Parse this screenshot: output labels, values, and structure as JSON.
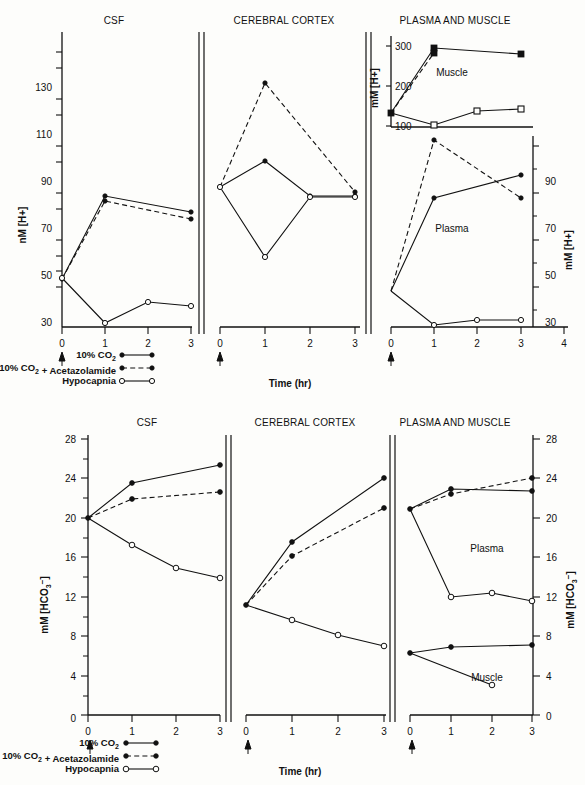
{
  "figure_top": {
    "panels": [
      "CSF",
      "CEREBRAL CORTEX",
      "PLASMA AND MUSCLE"
    ],
    "xlabel": "Time (hr)",
    "ylabel_left": "nM [H+]",
    "ylabel_right": "mM [H+]",
    "ylabel_muscle": "mM [H+]",
    "yticks_left": [
      30,
      50,
      70,
      90,
      110,
      130
    ],
    "yticks_right": [
      30,
      50,
      70,
      90
    ],
    "yticks_muscle": [
      100,
      200,
      300
    ],
    "xticks_p1": [
      0,
      1,
      2,
      3
    ],
    "xticks_p2": [
      0,
      1,
      2,
      3
    ],
    "xticks_p3": [
      0,
      1,
      2,
      3,
      4
    ],
    "series_labels": {
      "muscle": "Muscle",
      "plasma": "Plasma"
    }
  },
  "figure_bottom": {
    "panels": [
      "CSF",
      "CEREBRAL CORTEX",
      "PLASMA AND MUSCLE"
    ],
    "xlabel": "Time (hr)",
    "ylabel_left": "mM [HCO3-]",
    "ylabel_right": "mM [HCO3-]",
    "yticks": [
      0,
      4,
      8,
      12,
      16,
      20,
      24,
      28
    ],
    "xticks_p1": [
      0,
      1,
      2,
      3
    ],
    "xticks_p2": [
      0,
      1,
      2,
      3
    ],
    "xticks_p3": [
      0,
      1,
      2,
      3
    ],
    "series_labels": {
      "plasma": "Plasma",
      "muscle": "Muscle"
    }
  },
  "legend": {
    "items": [
      {
        "label": "10% CO2",
        "style": "solid-filled"
      },
      {
        "label": "10% CO2 + Acetazolamide",
        "style": "dashed-filled"
      },
      {
        "label": "Hypocapnia",
        "style": "solid-open"
      }
    ]
  },
  "chart_data": [
    {
      "type": "line",
      "title": "CSF",
      "figure": "top",
      "xlabel": "Time (hr)",
      "ylabel": "nM [H+]",
      "xlim": [
        0,
        3.4
      ],
      "ylim": [
        18,
        140
      ],
      "yticks": [
        30,
        50,
        70,
        90,
        110,
        130
      ],
      "grid": false,
      "series": [
        {
          "name": "10% CO2",
          "marker": "filled-circle",
          "line": "solid",
          "x": [
            0,
            1,
            3
          ],
          "values": [
            50,
            85,
            78
          ]
        },
        {
          "name": "10% CO2 + Acetazolamide",
          "marker": "filled-circle",
          "line": "dashed",
          "x": [
            0,
            1,
            3
          ],
          "values": [
            50,
            83,
            75
          ]
        },
        {
          "name": "Hypocapnia",
          "marker": "open-circle",
          "line": "solid",
          "x": [
            0,
            1,
            2,
            3
          ],
          "values": [
            50.5,
            31,
            41,
            40
          ]
        }
      ]
    },
    {
      "type": "line",
      "title": "CEREBRAL CORTEX",
      "figure": "top",
      "xlabel": "Time (hr)",
      "ylabel": "nM [H+]",
      "xlim": [
        0,
        3.4
      ],
      "ylim": [
        18,
        140
      ],
      "grid": false,
      "series": [
        {
          "name": "10% CO2",
          "marker": "filled-circle",
          "line": "solid",
          "x": [
            0,
            1,
            2,
            3
          ],
          "values": [
            89,
            100,
            85,
            85
          ]
        },
        {
          "name": "10% CO2 + Acetazolamide",
          "marker": "filled-circle",
          "line": "dashed",
          "x": [
            0,
            1,
            3
          ],
          "values": [
            89,
            133,
            87
          ]
        },
        {
          "name": "Hypocapnia",
          "marker": "open-circle",
          "line": "solid",
          "x": [
            0,
            1,
            2,
            3
          ],
          "values": [
            89,
            60,
            85,
            85
          ]
        }
      ]
    },
    {
      "type": "line",
      "title": "PLASMA AND MUSCLE (muscle)",
      "figure": "top",
      "xlabel": "Time (hr)",
      "ylabel": "mM [H+]",
      "ylim": [
        95,
        320
      ],
      "yticks": [
        100,
        200,
        300
      ],
      "grid": false,
      "series": [
        {
          "name": "10% CO2",
          "marker": "filled-square",
          "line": "solid",
          "x": [
            0,
            1,
            3
          ],
          "values": [
            135,
            296,
            281
          ]
        },
        {
          "name": "10% CO2 + Acetazolamide",
          "marker": "filled-square",
          "line": "dashed",
          "x": [
            0,
            1
          ],
          "values": [
            135,
            285
          ]
        },
        {
          "name": "Hypocapnia",
          "marker": "open-square",
          "line": "solid",
          "x": [
            0,
            1,
            2,
            3
          ],
          "values": [
            135,
            105,
            140,
            145
          ]
        }
      ]
    },
    {
      "type": "line",
      "title": "PLASMA AND MUSCLE (plasma)",
      "figure": "top",
      "xlabel": "Time (hr)",
      "ylabel": "mM [H+]",
      "ylim": [
        18,
        110
      ],
      "yticks": [
        30,
        50,
        70,
        90
      ],
      "grid": false,
      "series": [
        {
          "name": "10% CO2",
          "marker": "filled-circle",
          "line": "solid",
          "x": [
            0,
            1,
            3
          ],
          "values": [
            45,
            85,
            95
          ]
        },
        {
          "name": "10% CO2 + Acetazolamide",
          "marker": "filled-circle",
          "line": "dashed",
          "x": [
            0,
            1,
            3
          ],
          "values": [
            45,
            103,
            85
          ]
        },
        {
          "name": "Hypocapnia",
          "marker": "open-circle",
          "line": "solid",
          "x": [
            0,
            1,
            2,
            3
          ],
          "values": [
            45,
            30,
            32,
            32
          ]
        }
      ]
    },
    {
      "type": "line",
      "title": "CSF",
      "figure": "bottom",
      "xlabel": "Time (hr)",
      "ylabel": "mM [HCO3-]",
      "xlim": [
        0,
        3.4
      ],
      "ylim": [
        0,
        29
      ],
      "yticks": [
        0,
        4,
        8,
        12,
        16,
        20,
        24,
        28
      ],
      "grid": false,
      "series": [
        {
          "name": "10% CO2",
          "marker": "filled-circle",
          "line": "solid",
          "x": [
            0,
            1,
            3
          ],
          "values": [
            20,
            23.5,
            25.3
          ]
        },
        {
          "name": "10% CO2 + Acetazolamide",
          "marker": "filled-circle",
          "line": "dashed",
          "x": [
            0,
            1,
            3
          ],
          "values": [
            20,
            21.9,
            22.6
          ]
        },
        {
          "name": "Hypocapnia",
          "marker": "open-circle",
          "line": "solid",
          "x": [
            0,
            1,
            2,
            3
          ],
          "values": [
            20,
            17.3,
            15.0,
            14.0
          ]
        }
      ]
    },
    {
      "type": "line",
      "title": "CEREBRAL CORTEX",
      "figure": "bottom",
      "xlabel": "Time (hr)",
      "ylabel": "mM [HCO3-]",
      "xlim": [
        0,
        3.4
      ],
      "ylim": [
        0,
        29
      ],
      "grid": false,
      "series": [
        {
          "name": "10% CO2",
          "marker": "filled-circle",
          "line": "solid",
          "x": [
            0,
            1,
            3
          ],
          "values": [
            11.1,
            17.5,
            24.0
          ]
        },
        {
          "name": "10% CO2 + Acetazolamide",
          "marker": "filled-circle",
          "line": "dashed",
          "x": [
            0,
            1,
            3
          ],
          "values": [
            11.1,
            16.1,
            21.0
          ]
        },
        {
          "name": "Hypocapnia",
          "marker": "open-circle",
          "line": "solid",
          "x": [
            0,
            1,
            2,
            3
          ],
          "values": [
            11.1,
            9.6,
            8.1,
            7.0
          ]
        }
      ]
    },
    {
      "type": "line",
      "title": "PLASMA AND MUSCLE (plasma)",
      "figure": "bottom",
      "xlabel": "Time (hr)",
      "ylabel": "mM [HCO3-]",
      "ylim": [
        0,
        29
      ],
      "grid": false,
      "series": [
        {
          "name": "10% CO2",
          "marker": "filled-circle",
          "line": "solid",
          "x": [
            0,
            1,
            3
          ],
          "values": [
            21.0,
            23.0,
            22.8
          ]
        },
        {
          "name": "10% CO2 + Acetazolamide",
          "marker": "filled-circle",
          "line": "dashed",
          "x": [
            0,
            1,
            3
          ],
          "values": [
            21.0,
            22.5,
            24.0
          ]
        },
        {
          "name": "Hypocapnia",
          "marker": "open-circle",
          "line": "solid",
          "x": [
            0,
            1,
            2,
            3
          ],
          "values": [
            21.0,
            12.0,
            12.4,
            11.6
          ]
        }
      ]
    },
    {
      "type": "line",
      "title": "PLASMA AND MUSCLE (muscle)",
      "figure": "bottom",
      "xlabel": "Time (hr)",
      "ylabel": "mM [HCO3-]",
      "ylim": [
        0,
        29
      ],
      "grid": false,
      "series": [
        {
          "name": "10% CO2",
          "marker": "filled-circle",
          "line": "solid",
          "x": [
            0,
            1,
            3
          ],
          "values": [
            6.3,
            6.9,
            7.1
          ]
        },
        {
          "name": "Hypocapnia",
          "marker": "open-circle",
          "line": "solid",
          "x": [
            0,
            2
          ],
          "values": [
            6.3,
            3.0
          ]
        }
      ]
    }
  ]
}
